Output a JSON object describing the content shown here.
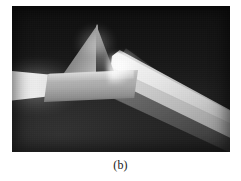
{
  "figure": {
    "caption": "(b)",
    "rendering": "grayscale photograph",
    "frame": {
      "left": 12,
      "top": 6,
      "width": 218,
      "height": 146
    },
    "colors": {
      "page_background": "#ffffff",
      "photo_background_dark": "#151515",
      "photo_background_light": "#323232",
      "prism_highlight": "#d2d2d2",
      "prism_shadow": "#3d3d3d",
      "beam_core": "#f2f2f2",
      "fan_core": "#d5d5d5",
      "caption_text": "#1a1a1a"
    },
    "elements": {
      "incoming_beam_label": "incident white-light beam",
      "prism_label": "triangular prism",
      "dispersed_beam_label": "dispersed output fan"
    }
  }
}
